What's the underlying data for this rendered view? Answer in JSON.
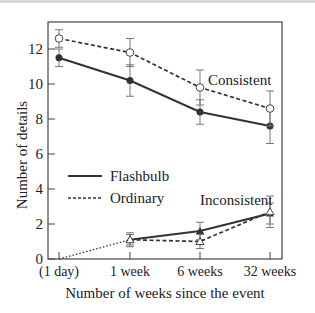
{
  "chart_data": {
    "type": "line",
    "title": "",
    "xlabel": "Number of weeks since the event",
    "ylabel": "Number of details",
    "categories": [
      "(1 day)",
      "1 week",
      "6 weeks",
      "32 weeks"
    ],
    "ylim": [
      0,
      13.5
    ],
    "yticks": [
      0,
      2,
      4,
      6,
      8,
      10,
      12
    ],
    "grid": false,
    "legend": {
      "position": "left-middle inside",
      "entries": [
        {
          "label": "Flashbulb",
          "style": "solid"
        },
        {
          "label": "Ordinary",
          "style": "dashed"
        }
      ]
    },
    "annotations": [
      "Consistent",
      "Inconsistent"
    ],
    "series": [
      {
        "name": "Flashbulb - Consistent",
        "style": "solid",
        "marker": "filled-circle",
        "values": [
          11.5,
          10.2,
          8.4,
          7.6
        ],
        "errors": [
          0.5,
          0.9,
          0.7,
          1.0
        ]
      },
      {
        "name": "Ordinary - Consistent",
        "style": "dashed",
        "marker": "open-circle",
        "values": [
          12.6,
          11.8,
          9.8,
          8.6
        ],
        "errors": [
          0.5,
          0.8,
          1.0,
          1.0
        ]
      },
      {
        "name": "Flashbulb - Inconsistent",
        "style": "solid",
        "marker": "filled-triangle",
        "values": [
          null,
          1.1,
          1.6,
          2.6
        ],
        "errors": [
          null,
          0.3,
          0.5,
          0.6
        ]
      },
      {
        "name": "Ordinary - Inconsistent",
        "style": "dashed",
        "marker": "open-triangle",
        "values": [
          null,
          1.1,
          1.0,
          2.7
        ],
        "errors": [
          null,
          0.4,
          0.4,
          0.9
        ]
      },
      {
        "name": "Baseline (1 day to 1 week)",
        "style": "dotted",
        "marker": "none",
        "values": [
          0,
          1.1,
          null,
          null
        ]
      }
    ]
  },
  "labels": {
    "consistent": "Consistent",
    "inconsistent": "Inconsistent",
    "legend_flashbulb": "Flashbulb",
    "legend_ordinary": "Ordinary"
  }
}
